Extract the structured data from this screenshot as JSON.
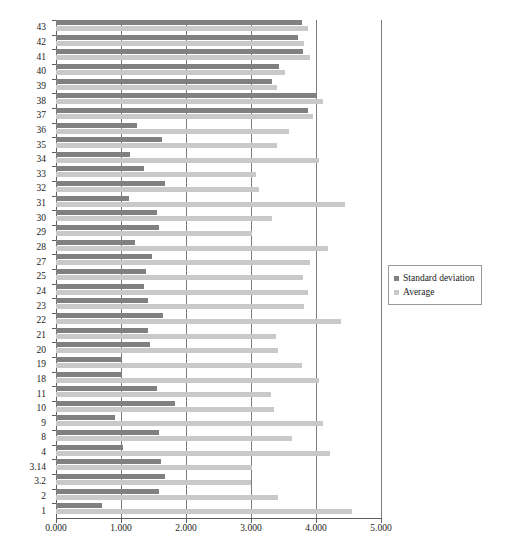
{
  "chart_data": {
    "type": "bar",
    "orientation": "horizontal",
    "title": "",
    "xlabel": "",
    "ylabel": "",
    "xlim": [
      0,
      5
    ],
    "grid": true,
    "legend_position": "right",
    "xticks": [
      "0.000",
      "1.000",
      "2.000",
      "3.000",
      "4.000",
      "5.000"
    ],
    "xtick_values": [
      0,
      1,
      2,
      3,
      4,
      5
    ],
    "categories": [
      "43",
      "42",
      "41",
      "40",
      "39",
      "38",
      "37",
      "36",
      "35",
      "34",
      "33",
      "32",
      "31",
      "30",
      "29",
      "28",
      "27",
      "25",
      "24",
      "23",
      "22",
      "21",
      "20",
      "19",
      "18",
      "11",
      "10",
      "9",
      "8",
      "4",
      "3.14",
      "3.2",
      "2",
      "1"
    ],
    "series": [
      {
        "name": "Standard deviation",
        "color": "#808080",
        "values": [
          3.78,
          3.72,
          3.8,
          3.43,
          3.33,
          4.02,
          3.87,
          1.25,
          1.63,
          1.14,
          1.35,
          1.68,
          1.13,
          1.55,
          1.58,
          1.22,
          1.47,
          1.38,
          1.35,
          1.42,
          1.65,
          1.42,
          1.45,
          1.0,
          1.0,
          1.55,
          1.83,
          0.9,
          1.58,
          1.03,
          1.62,
          1.67,
          1.58,
          0.7
        ]
      },
      {
        "name": "Average",
        "color": "#c9c9c9",
        "values": [
          3.88,
          3.82,
          3.9,
          3.53,
          3.4,
          4.1,
          3.95,
          3.58,
          3.4,
          4.05,
          3.07,
          3.12,
          4.45,
          3.33,
          3.02,
          4.18,
          3.9,
          3.8,
          3.88,
          3.82,
          4.38,
          3.38,
          3.42,
          3.78,
          4.05,
          3.3,
          3.35,
          4.1,
          3.63,
          4.22,
          3.02,
          3.0,
          3.42,
          4.55
        ]
      }
    ]
  },
  "legend": {
    "items": [
      {
        "label": "Standard deviation",
        "color": "#808080"
      },
      {
        "label": "Average",
        "color": "#c9c9c9"
      }
    ]
  }
}
